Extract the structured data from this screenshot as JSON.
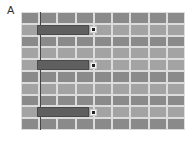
{
  "panel": {
    "label": "A"
  },
  "grid": {
    "rows": 10,
    "cols": 9,
    "row_shades": [
      "#8a8a8a",
      "#a3a3a3",
      "#8a8a8a",
      "#a3a3a3",
      "#a3a3a3",
      "#8a8a8a",
      "#a3a3a3",
      "#8a8a8a",
      "#a3a3a3",
      "#8a8a8a"
    ],
    "line_color": "#dcdcdc"
  },
  "bars": [
    {
      "row": 2,
      "start_col": 1,
      "end_fraction": 3.75
    },
    {
      "row": 5,
      "start_col": 1,
      "end_fraction": 3.75
    },
    {
      "row": 9,
      "start_col": 1,
      "end_fraction": 3.75
    }
  ],
  "colors": {
    "bar": "#5f5f5f",
    "axis": "#444444",
    "marker": "#222222"
  }
}
